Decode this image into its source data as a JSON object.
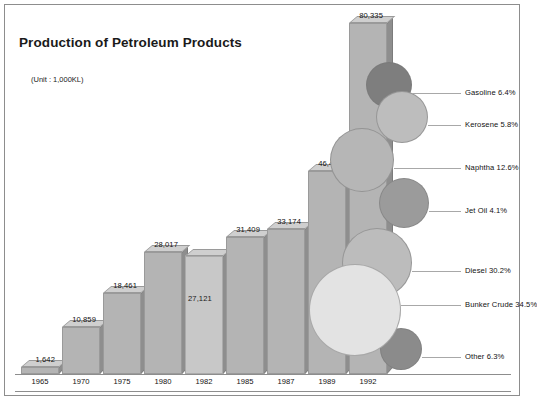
{
  "chart_data": {
    "type": "bar",
    "title": "Production of Petroleum Products",
    "unit_note": "(Unit : 1,000KL)",
    "xlabel": "",
    "ylabel": "",
    "ylim": [
      0,
      80335
    ],
    "grid": false,
    "categories": [
      "1965",
      "1970",
      "1975",
      "1980",
      "1982",
      "1985",
      "1987",
      "1989",
      "1992"
    ],
    "values": [
      1642,
      10859,
      18461,
      28017,
      27121,
      31409,
      33174,
      46433,
      80335
    ],
    "value_labels": [
      "1,642",
      "10,859",
      "18,461",
      "28,017",
      "27,121",
      "31,409",
      "33,174",
      "46,433",
      "80,335"
    ],
    "legend_position": "right",
    "breakdown": {
      "type": "pie",
      "note": "proportional bubbles for 1992 product mix",
      "labels": [
        "Gasoline 6.4%",
        "Kerosene 5.8%",
        "Naphtha 12.6%",
        "Jet Oil  4.1%",
        "Diesel 30.2%",
        "Bunker Crude 34.5%",
        "Other 6.3%"
      ],
      "names": [
        "Gasoline",
        "Kerosene",
        "Naphtha",
        "Jet Oil",
        "Diesel",
        "Bunker Crude",
        "Other"
      ],
      "values": [
        6.4,
        5.8,
        12.6,
        4.1,
        30.2,
        34.5,
        6.3
      ],
      "colors": [
        "#7e7e7e",
        "#bdbdbd",
        "#b6b6b6",
        "#9b9b9b",
        "#bcbcbc",
        "#e3e3e3",
        "#8b8b8b"
      ]
    }
  },
  "bars": [
    {
      "year": "1965",
      "label": "1,642",
      "value": 1642
    },
    {
      "year": "1970",
      "label": "10,859",
      "value": 10859
    },
    {
      "year": "1975",
      "label": "18,461",
      "value": 18461
    },
    {
      "year": "1980",
      "label": "28,017",
      "value": 28017
    },
    {
      "year": "1982",
      "label": "27,121",
      "value": 27121
    },
    {
      "year": "1985",
      "label": "31,409",
      "value": 31409
    },
    {
      "year": "1987",
      "label": "33,174",
      "value": 33174
    },
    {
      "year": "1989",
      "label": "46,433",
      "value": 46433
    },
    {
      "year": "1992",
      "label": "80,335",
      "value": 80335
    }
  ],
  "legend": [
    {
      "label": "Gasoline 6.4%"
    },
    {
      "label": "Kerosene 5.8%"
    },
    {
      "label": "Naphtha 12.6%"
    },
    {
      "label": "Jet Oil  4.1%"
    },
    {
      "label": "Diesel 30.2%"
    },
    {
      "label": "Bunker Crude 34.5%"
    },
    {
      "label": "Other 6.3%"
    }
  ],
  "colors": {
    "bar_front": "#b4b4b4",
    "bar_front_pale": "#c8c8c8",
    "bar_top": "#cfcfcf",
    "bar_side": "#8e8e8e",
    "border": "#8d8d8d",
    "text": "#1a1a1a"
  }
}
